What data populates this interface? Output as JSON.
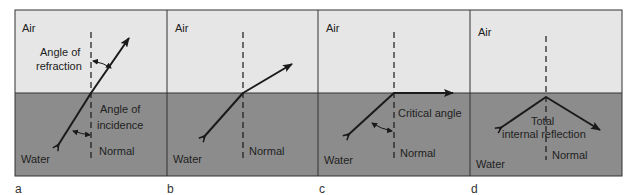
{
  "colors": {
    "air": "#e6e6e6",
    "water": "#8c8c8c",
    "line": "#1a1a1a",
    "frame": "#333333"
  },
  "panels": [
    {
      "id": "a",
      "caption": "a",
      "medium_top": "Air",
      "medium_bottom": "Water",
      "labels": {
        "refraction_line1": "Angle of",
        "refraction_line2": "refraction",
        "incidence_line1": "Angle of",
        "incidence_line2": "incidence",
        "normal": "Normal"
      }
    },
    {
      "id": "b",
      "caption": "b",
      "medium_top": "Air",
      "medium_bottom": "Water",
      "labels": {
        "normal": "Normal"
      }
    },
    {
      "id": "c",
      "caption": "c",
      "medium_top": "Air",
      "medium_bottom": "Water",
      "labels": {
        "critical": "Critical angle",
        "normal": "Normal"
      }
    },
    {
      "id": "d",
      "caption": "d",
      "medium_top": "Air",
      "medium_bottom": "Water",
      "labels": {
        "tir_line1": "Total",
        "tir_line2": "internal reflection",
        "normal": "Normal"
      }
    }
  ]
}
